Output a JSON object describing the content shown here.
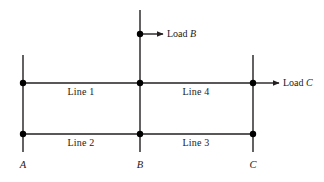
{
  "diagram": {
    "stroke_color": "#231f20",
    "node_color": "#000000",
    "background": "#ffffff",
    "buses": [
      {
        "id": "A",
        "label": "A",
        "x": 23,
        "label_x": 23,
        "label_y": 166
      },
      {
        "id": "B",
        "label": "B",
        "x": 140,
        "label_x": 140,
        "label_y": 166
      },
      {
        "id": "C",
        "label": "C",
        "x": 253,
        "label_x": 253,
        "label_y": 166
      }
    ],
    "lines": [
      {
        "id": "line1",
        "label": "Line 1",
        "from": "A",
        "to": "B",
        "row": "top",
        "label_x": 81,
        "label_y": 93
      },
      {
        "id": "line4",
        "label": "Line 4",
        "from": "B",
        "to": "C",
        "row": "top",
        "label_x": 196,
        "label_y": 93
      },
      {
        "id": "line2",
        "label": "Line 2",
        "from": "A",
        "to": "B",
        "row": "bottom",
        "label_x": 81,
        "label_y": 144
      },
      {
        "id": "line3",
        "label": "Line 3",
        "from": "B",
        "to": "C",
        "row": "bottom",
        "label_x": 196,
        "label_y": 144
      }
    ],
    "loads": [
      {
        "id": "load-b",
        "text": "Load ",
        "italic": "B",
        "label_x": 167,
        "label_y": 29,
        "arrow_from_x": 141,
        "arrow_to_x": 163,
        "arrow_y": 34
      },
      {
        "id": "load-c",
        "text": "Load ",
        "italic": "C",
        "label_x": 283,
        "label_y": 78,
        "arrow_from_x": 254,
        "arrow_to_x": 279,
        "arrow_y": 83
      }
    ],
    "geometry": {
      "top_rail_y": 83,
      "bottom_rail_y": 134,
      "rail_left_x": 23,
      "rail_right_x": 253,
      "vertical_top_y_outer": 55,
      "vertical_top_y_center": 10,
      "vertical_bottom_y": 152,
      "node_radius": 3.2,
      "stroke_width": 1.4
    },
    "nodes": [
      {
        "id": "node-a-top",
        "x": 23,
        "y": 83
      },
      {
        "id": "node-b-top",
        "x": 140,
        "y": 83
      },
      {
        "id": "node-c-top",
        "x": 253,
        "y": 83
      },
      {
        "id": "node-a-bottom",
        "x": 23,
        "y": 134
      },
      {
        "id": "node-b-bottom",
        "x": 140,
        "y": 134
      },
      {
        "id": "node-c-bottom",
        "x": 253,
        "y": 134
      },
      {
        "id": "node-b-load",
        "x": 140,
        "y": 34
      }
    ]
  }
}
